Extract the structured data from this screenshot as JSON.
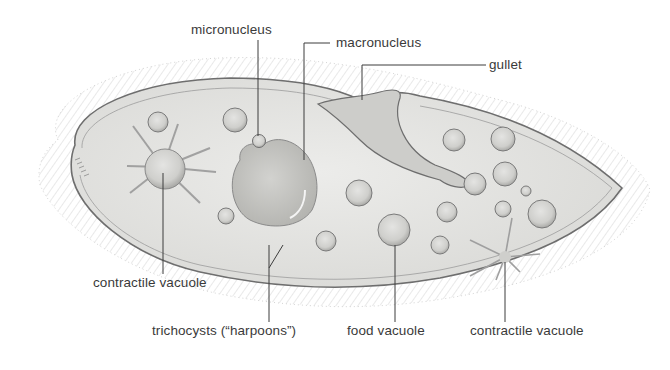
{
  "diagram": {
    "labels": {
      "micronucleus": "micronucleus",
      "macronucleus": "macronucleus",
      "gullet": "gullet",
      "contractile_vacuole_left": "contractile vacuole",
      "trichocysts": "trichocysts (“harpoons”)",
      "food_vacuole": "food vacuole",
      "contractile_vacuole_right": "contractile vacuole"
    },
    "colors": {
      "background": "#ffffff",
      "cell_fill": "#e6e6e4",
      "outline": "#6e6e6e",
      "cilia": "#8a8a8a",
      "leader_line": "#3c3c3c",
      "label_text": "#3a3a3a"
    }
  }
}
